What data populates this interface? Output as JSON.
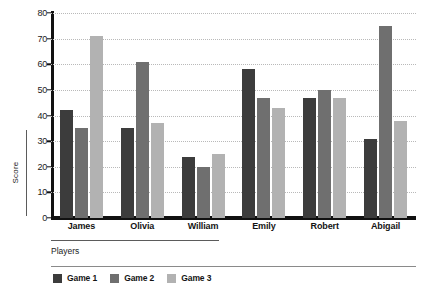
{
  "chart_data": {
    "type": "bar",
    "title": "",
    "xlabel": "Players",
    "ylabel": "Score",
    "ylim": [
      0,
      80
    ],
    "yticks": [
      0,
      10,
      20,
      30,
      40,
      50,
      60,
      70,
      80
    ],
    "grid": true,
    "legend_position": "bottom-left",
    "categories": [
      "James",
      "Olivia",
      "William",
      "Emily",
      "Robert",
      "Abigail"
    ],
    "series": [
      {
        "name": "Game 1",
        "color": "#3c3c3c",
        "values": [
          42,
          35,
          24,
          58,
          47,
          31
        ]
      },
      {
        "name": "Game 2",
        "color": "#6f6f6f",
        "values": [
          35,
          61,
          20,
          47,
          50,
          75
        ]
      },
      {
        "name": "Game 3",
        "color": "#b2b2b2",
        "values": [
          71,
          37,
          25,
          43,
          47,
          38
        ]
      }
    ]
  },
  "axes": {
    "y_label": "Score",
    "x_label": "Players",
    "tick_labels": [
      "80",
      "70",
      "60",
      "50",
      "40",
      "30",
      "20",
      "10",
      "0"
    ]
  },
  "legend": {
    "items": [
      {
        "label": "Game 1",
        "color": "#3c3c3c"
      },
      {
        "label": "Game 2",
        "color": "#6f6f6f"
      },
      {
        "label": "Game 3",
        "color": "#b2b2b2"
      }
    ]
  },
  "colors": {
    "background": "#ffffff",
    "axis": "#111111",
    "gridline": "#b9b9b9",
    "text": "#141414",
    "rule": "#5b5b5b",
    "series_1": "#3c3c3c",
    "series_2": "#6f6f6f",
    "series_3": "#b2b2b2"
  }
}
